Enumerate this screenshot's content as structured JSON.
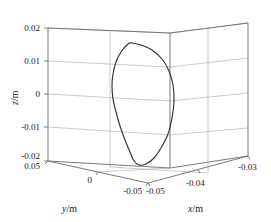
{
  "chart_data": {
    "type": "line",
    "title": "",
    "projection": "3d",
    "xlabel": "x/m",
    "ylabel": "y/m",
    "zlabel": "z/m",
    "xlim": [
      -0.05,
      -0.03
    ],
    "ylim": [
      -0.05,
      0.05
    ],
    "zlim": [
      -0.02,
      0.02
    ],
    "xticks": [
      "-0.05",
      "-0.04",
      "-0.03"
    ],
    "yticks": [
      "0.05",
      "0",
      "-0.05"
    ],
    "zticks": [
      "0.02",
      "0.01",
      "0",
      "-0.01",
      "-0.02"
    ],
    "grid": true,
    "legend": "none",
    "series": [
      {
        "name": "trajectory",
        "closed": true,
        "color": "#333333",
        "description": "closed crescent-shaped orbit loop",
        "points_px": [
          [
            128,
            44
          ],
          [
            121,
            52
          ],
          [
            116,
            62
          ],
          [
            113,
            74
          ],
          [
            112,
            86
          ],
          [
            113,
            99
          ],
          [
            116,
            112
          ],
          [
            120,
            126
          ],
          [
            125,
            140
          ],
          [
            130,
            152
          ],
          [
            134,
            161
          ],
          [
            139,
            165
          ],
          [
            146,
            164
          ],
          [
            154,
            158
          ],
          [
            161,
            148
          ],
          [
            168,
            134
          ],
          [
            172,
            118
          ],
          [
            174,
            101
          ],
          [
            173,
            85
          ],
          [
            169,
            71
          ],
          [
            162,
            59
          ],
          [
            152,
            50
          ],
          [
            141,
            45
          ],
          [
            132,
            43
          ],
          [
            128,
            44
          ]
        ]
      }
    ]
  },
  "axes": {
    "z": {
      "label": "z/m",
      "label_var": "z",
      "label_unit": "/m",
      "ticks": [
        {
          "text": "0.02"
        },
        {
          "text": "0.01"
        },
        {
          "text": "0"
        },
        {
          "text": "-0.01"
        },
        {
          "text": "-0.02"
        }
      ]
    },
    "y": {
      "label": "y/m",
      "label_var": "y",
      "label_unit": "/m",
      "ticks": [
        {
          "text": "0.05"
        },
        {
          "text": "0"
        },
        {
          "text": "-0.05"
        }
      ]
    },
    "x": {
      "label": "x/m",
      "label_var": "x",
      "label_unit": "/m",
      "ticks": [
        {
          "text": "-0.05"
        },
        {
          "text": "-0.04"
        },
        {
          "text": "-0.03"
        }
      ]
    }
  },
  "colors": {
    "curve": "#333333",
    "frame": "#6b6b6b",
    "grid": "#a8a8a8",
    "text": "#1a1a1a",
    "background": "#ffffff"
  }
}
